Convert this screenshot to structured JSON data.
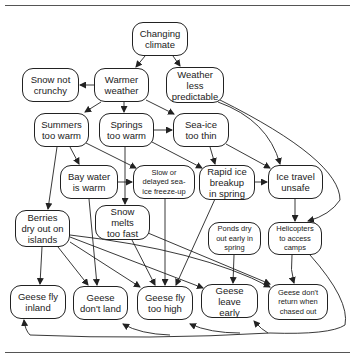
{
  "diagram": {
    "type": "causal-flow",
    "nodes": [
      {
        "id": "changing_climate",
        "label": "Changing\nclimate"
      },
      {
        "id": "snow_not_crunchy",
        "label": "Snow not\ncrunchy"
      },
      {
        "id": "warmer_weather",
        "label": "Warmer\nweather"
      },
      {
        "id": "weather_less_predictable",
        "label": "Weather\nless\npredictable"
      },
      {
        "id": "summers_too_warm",
        "label": "Summers\ntoo warm"
      },
      {
        "id": "springs_too_warm",
        "label": "Springs\ntoo warm"
      },
      {
        "id": "sea_ice_too_thin",
        "label": "Sea-ice\ntoo thin"
      },
      {
        "id": "bay_water_is_warm",
        "label": "Bay water\nis warm"
      },
      {
        "id": "slow_freeze_up",
        "label": "Slow or\ndelayed sea-\nice freeze-up"
      },
      {
        "id": "rapid_ice_breakup",
        "label": "Rapid ice\nbreakup\nin spring"
      },
      {
        "id": "ice_travel_unsafe",
        "label": "Ice travel\nunsafe"
      },
      {
        "id": "berries_dry_out",
        "label": "Berries\ndry out on\nislands"
      },
      {
        "id": "snow_melts_too_fast",
        "label": "Snow\nmelts\ntoo fast"
      },
      {
        "id": "ponds_dry_out",
        "label": "Ponds dry\nout early in\nspring"
      },
      {
        "id": "helicopters",
        "label": "Helicopters\nto access\ncamps"
      },
      {
        "id": "geese_fly_inland",
        "label": "Geese fly\ninland"
      },
      {
        "id": "geese_dont_land",
        "label": "Geese\ndon't land"
      },
      {
        "id": "geese_fly_too_high",
        "label": "Geese fly\ntoo high"
      },
      {
        "id": "geese_leave_early",
        "label": "Geese\nleave\nearly"
      },
      {
        "id": "geese_dont_return",
        "label": "Geese don't\nreturn when\nchased out"
      }
    ],
    "edges": [
      [
        "changing_climate",
        "warmer_weather"
      ],
      [
        "changing_climate",
        "weather_less_predictable"
      ],
      [
        "warmer_weather",
        "snow_not_crunchy"
      ],
      [
        "warmer_weather",
        "summers_too_warm"
      ],
      [
        "warmer_weather",
        "springs_too_warm"
      ],
      [
        "warmer_weather",
        "sea_ice_too_thin"
      ],
      [
        "weather_less_predictable",
        "ice_travel_unsafe"
      ],
      [
        "weather_less_predictable",
        "helicopters"
      ],
      [
        "summers_too_warm",
        "bay_water_is_warm"
      ],
      [
        "summers_too_warm",
        "slow_freeze_up"
      ],
      [
        "summers_too_warm",
        "berries_dry_out"
      ],
      [
        "springs_too_warm",
        "sea_ice_too_thin"
      ],
      [
        "springs_too_warm",
        "rapid_ice_breakup"
      ],
      [
        "springs_too_warm",
        "snow_melts_too_fast"
      ],
      [
        "sea_ice_too_thin",
        "rapid_ice_breakup"
      ],
      [
        "sea_ice_too_thin",
        "ice_travel_unsafe"
      ],
      [
        "bay_water_is_warm",
        "slow_freeze_up"
      ],
      [
        "bay_water_is_warm",
        "geese_dont_land"
      ],
      [
        "slow_freeze_up",
        "geese_fly_too_high"
      ],
      [
        "rapid_ice_breakup",
        "ice_travel_unsafe"
      ],
      [
        "rapid_ice_breakup",
        "geese_fly_too_high"
      ],
      [
        "ice_travel_unsafe",
        "helicopters"
      ],
      [
        "berries_dry_out",
        "geese_fly_inland"
      ],
      [
        "berries_dry_out",
        "geese_dont_land"
      ],
      [
        "berries_dry_out",
        "geese_fly_too_high"
      ],
      [
        "berries_dry_out",
        "geese_leave_early"
      ],
      [
        "berries_dry_out",
        "geese_dont_return"
      ],
      [
        "snow_melts_too_fast",
        "geese_fly_too_high"
      ],
      [
        "snow_melts_too_fast",
        "geese_dont_return"
      ],
      [
        "ponds_dry_out",
        "geese_leave_early"
      ],
      [
        "helicopters",
        "geese_dont_return"
      ],
      [
        "helicopters",
        "geese_fly_inland"
      ],
      [
        "helicopters",
        "geese_dont_land"
      ],
      [
        "helicopters",
        "geese_fly_too_high"
      ],
      [
        "helicopters",
        "geese_leave_early"
      ]
    ]
  }
}
